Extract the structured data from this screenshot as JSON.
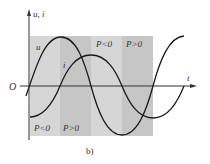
{
  "figure": {
    "caption": "b)",
    "axis_label_y": "u, i",
    "axis_label_x": "t",
    "origin_label": "O",
    "curve_labels": {
      "u": "u",
      "i": "i"
    },
    "regions": [
      {
        "label": "P<0",
        "sign": "negative",
        "color": "#d6d6d6",
        "label_pos": "bottom"
      },
      {
        "label": "P>0",
        "sign": "positive",
        "color": "#c4c4c4",
        "label_pos": "bottom"
      },
      {
        "label": "P<0",
        "sign": "negative",
        "color": "#d6d6d6",
        "label_pos": "top"
      },
      {
        "label": "P>0",
        "sign": "positive",
        "color": "#c4c4c4",
        "label_pos": "top"
      }
    ],
    "colors": {
      "curve": "#1a1a1a",
      "axis": "#333333",
      "background": "#ffffff"
    }
  }
}
